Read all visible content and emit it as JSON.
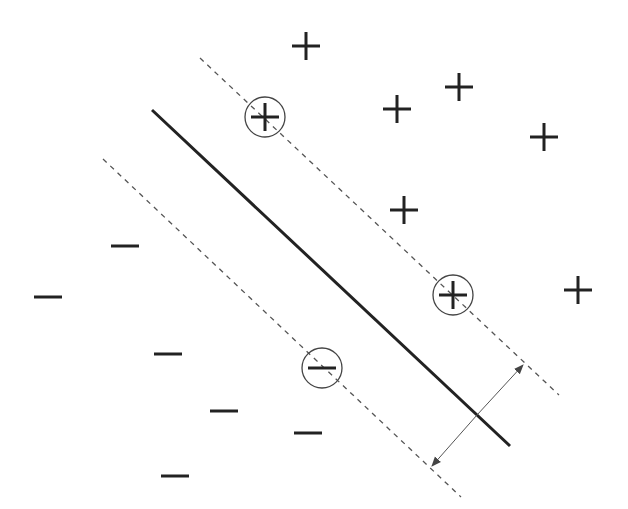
{
  "diagram": {
    "colors": {
      "ink": "#222222",
      "dash": "#555555",
      "circle": "#444444",
      "arrow": "#555555",
      "background": "#ffffff"
    },
    "legend": {
      "positive_class": "+",
      "negative_class": "−",
      "decision_boundary": "hyperplane",
      "margins": "margin boundaries",
      "support_vectors": "support vectors (circled)",
      "margin_arrow": "margin width"
    },
    "positive_points": [
      {
        "id": "p1",
        "support": false
      },
      {
        "id": "p2",
        "support": false
      },
      {
        "id": "p3",
        "support": false
      },
      {
        "id": "p4",
        "support": false
      },
      {
        "id": "p5",
        "support": false
      },
      {
        "id": "p6",
        "support": false
      },
      {
        "id": "p7",
        "support": true
      },
      {
        "id": "p8",
        "support": true
      }
    ],
    "negative_points": [
      {
        "id": "n1",
        "support": false
      },
      {
        "id": "n2",
        "support": false
      },
      {
        "id": "n3",
        "support": false
      },
      {
        "id": "n4",
        "support": false
      },
      {
        "id": "n5",
        "support": false
      },
      {
        "id": "n6",
        "support": false
      },
      {
        "id": "n7",
        "support": true
      }
    ]
  }
}
